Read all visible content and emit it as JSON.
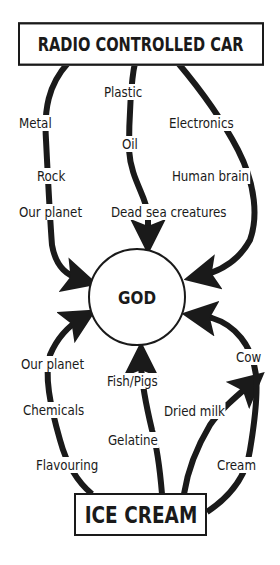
{
  "diagram": {
    "title_top": "RADIO CONTROLLED CAR",
    "center": "GOD",
    "title_bottom": "ICE CREAM",
    "colors": {
      "ink": "#1a1a1a",
      "background": "#ffffff"
    },
    "chains": [
      {
        "id": "car-left",
        "from": "RADIO CONTROLLED CAR",
        "to": "GOD",
        "steps": [
          "Metal",
          "Rock",
          "Our planet"
        ]
      },
      {
        "id": "car-middle",
        "from": "RADIO CONTROLLED CAR",
        "to": "GOD",
        "steps": [
          "Plastic",
          "Oil",
          "Dead sea creatures"
        ]
      },
      {
        "id": "car-right",
        "from": "RADIO CONTROLLED CAR",
        "to": "GOD",
        "steps": [
          "Electronics",
          "Human brain"
        ]
      },
      {
        "id": "ice-left",
        "from": "ICE CREAM",
        "to": "GOD",
        "steps": [
          "Flavouring",
          "Chemicals",
          "Our planet"
        ]
      },
      {
        "id": "ice-middle",
        "from": "ICE CREAM",
        "to": "GOD",
        "steps": [
          "Gelatine",
          "Fish/Pigs"
        ]
      },
      {
        "id": "ice-right-inner",
        "from": "ICE CREAM",
        "to": "Cow",
        "steps": [
          "Dried milk",
          "Cow"
        ]
      },
      {
        "id": "ice-right-outer",
        "from": "ICE CREAM",
        "to": "GOD",
        "steps": [
          "Cream",
          "Cow"
        ]
      }
    ],
    "labels": {
      "metal": "Metal",
      "rock": "Rock",
      "our_planet_top": "Our planet",
      "plastic": "Plastic",
      "oil": "Oil",
      "dead_sea_creatures": "Dead sea creatures",
      "electronics": "Electronics",
      "human_brain": "Human brain",
      "our_planet_bottom": "Our planet",
      "chemicals": "Chemicals",
      "flavouring": "Flavouring",
      "fish_pigs": "Fish/Pigs",
      "gelatine": "Gelatine",
      "dried_milk": "Dried milk",
      "cow": "Cow",
      "cream": "Cream"
    }
  }
}
